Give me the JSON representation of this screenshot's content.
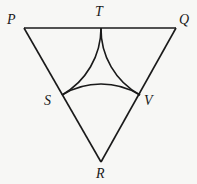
{
  "diagram": {
    "type": "geometry",
    "points": {
      "P": {
        "label": "P",
        "x": 24,
        "y": 28
      },
      "Q": {
        "label": "Q",
        "x": 176,
        "y": 28
      },
      "R": {
        "label": "R",
        "x": 101,
        "y": 162
      },
      "T": {
        "label": "T",
        "x": 101,
        "y": 28
      },
      "S": {
        "label": "S",
        "x": 62,
        "y": 95
      },
      "V": {
        "label": "V",
        "x": 140,
        "y": 95
      }
    },
    "segments": [
      "PQ",
      "QR",
      "RP"
    ],
    "arcs": [
      {
        "from": "T",
        "to": "S",
        "center": "P"
      },
      {
        "from": "T",
        "to": "V",
        "center": "Q"
      },
      {
        "from": "S",
        "to": "V",
        "center": "R"
      }
    ],
    "labels": {
      "P": "P",
      "Q": "Q",
      "R": "R",
      "T": "T",
      "S": "S",
      "V": "V"
    },
    "colors": {
      "stroke": "#1a1a1a",
      "background": "#f7f7f5"
    }
  }
}
